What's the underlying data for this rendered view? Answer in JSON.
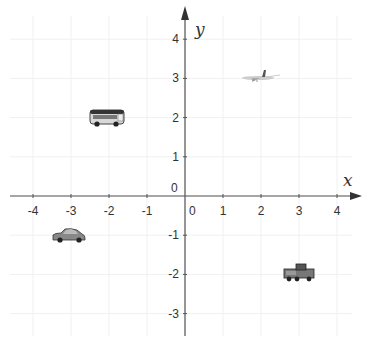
{
  "chart_data": {
    "type": "scatter",
    "title": "",
    "xlabel": "x",
    "ylabel": "y",
    "xlim": [
      -4.4,
      4.6
    ],
    "ylim": [
      -3.6,
      4.4
    ],
    "grid": true,
    "x_ticks": [
      "-4",
      "-3",
      "-2",
      "-1",
      "0",
      "1",
      "2",
      "3",
      "4"
    ],
    "y_ticks": [
      "4",
      "3",
      "2",
      "1",
      "0",
      "-1",
      "-2",
      "-3"
    ],
    "points": [
      {
        "label": "bus",
        "x": -2,
        "y": 2
      },
      {
        "label": "airplane",
        "x": 2,
        "y": 3
      },
      {
        "label": "car",
        "x": -3,
        "y": -1
      },
      {
        "label": "truck",
        "x": 3,
        "y": -2
      }
    ]
  },
  "axes": {
    "x_label": "x",
    "y_label": "y",
    "origin_label": "0"
  },
  "colors": {
    "axis": "#555555",
    "grid": "#f0f0f0",
    "text": "#333333"
  }
}
